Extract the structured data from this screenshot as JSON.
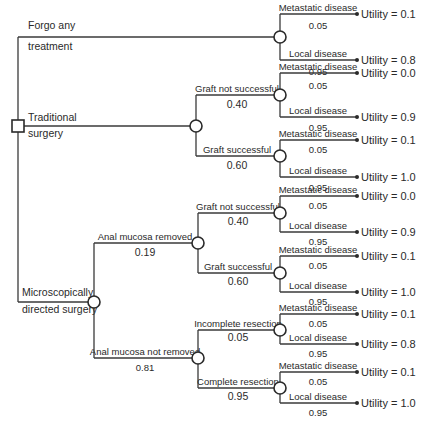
{
  "root": {
    "type": "decision",
    "options": [
      {
        "label_line1": "Forgo any",
        "label_line2": "treatment"
      },
      {
        "label_line1": "Traditional",
        "label_line2": "surgery"
      },
      {
        "label_line1": "Microscopically",
        "label_line2": "directed surgery"
      }
    ]
  },
  "forgo": {
    "outcomes": [
      {
        "label": "Metastatic disease",
        "prob": "0.05",
        "utility": "Utility = 0.1"
      },
      {
        "label": "Local disease",
        "prob": "0.95",
        "utility": "Utility = 0.8"
      }
    ]
  },
  "traditional": {
    "branches": [
      {
        "label": "Graft not successful",
        "prob": "0.40",
        "outcomes": [
          {
            "label": "Metastatic disease",
            "prob": "0.05",
            "utility": "Utility = 0.0"
          },
          {
            "label": "Local disease",
            "prob": "0.95",
            "utility": "Utility = 0.9"
          }
        ]
      },
      {
        "label": "Graft successful",
        "prob": "0.60",
        "outcomes": [
          {
            "label": "Metastatic disease",
            "prob": "0.05",
            "utility": "Utility = 0.1"
          },
          {
            "label": "Local disease",
            "prob": "0.95",
            "utility": "Utility = 1.0"
          }
        ]
      }
    ]
  },
  "micro": {
    "branches": [
      {
        "label": "Anal mucosa removed",
        "prob": "0.19",
        "branches": [
          {
            "label": "Graft not successful",
            "prob": "0.40",
            "outcomes": [
              {
                "label": "Metastatic disease",
                "prob": "0.05",
                "utility": "Utility = 0.0"
              },
              {
                "label": "Local disease",
                "prob": "0.95",
                "utility": "Utility = 0.9"
              }
            ]
          },
          {
            "label": "Graft successful",
            "prob": "0.60",
            "outcomes": [
              {
                "label": "Metastatic disease",
                "prob": "0.05",
                "utility": "Utility = 0.1"
              },
              {
                "label": "Local disease",
                "prob": "0.95",
                "utility": "Utility = 1.0"
              }
            ]
          }
        ]
      },
      {
        "label": "Anal mucosa not removed",
        "prob": "0.81",
        "branches": [
          {
            "label": "Incomplete resection",
            "prob": "0.05",
            "outcomes": [
              {
                "label": "Metastatic disease",
                "prob": "0.05",
                "utility": "Utility = 0.1"
              },
              {
                "label": "Local disease",
                "prob": "0.95",
                "utility": "Utility = 0.8"
              }
            ]
          },
          {
            "label": "Complete resection",
            "prob": "0.95",
            "outcomes": [
              {
                "label": "Metastatic disease",
                "prob": "0.05",
                "utility": "Utility = 0.1"
              },
              {
                "label": "Local disease",
                "prob": "0.95",
                "utility": "Utility = 1.0"
              }
            ]
          }
        ]
      }
    ]
  }
}
